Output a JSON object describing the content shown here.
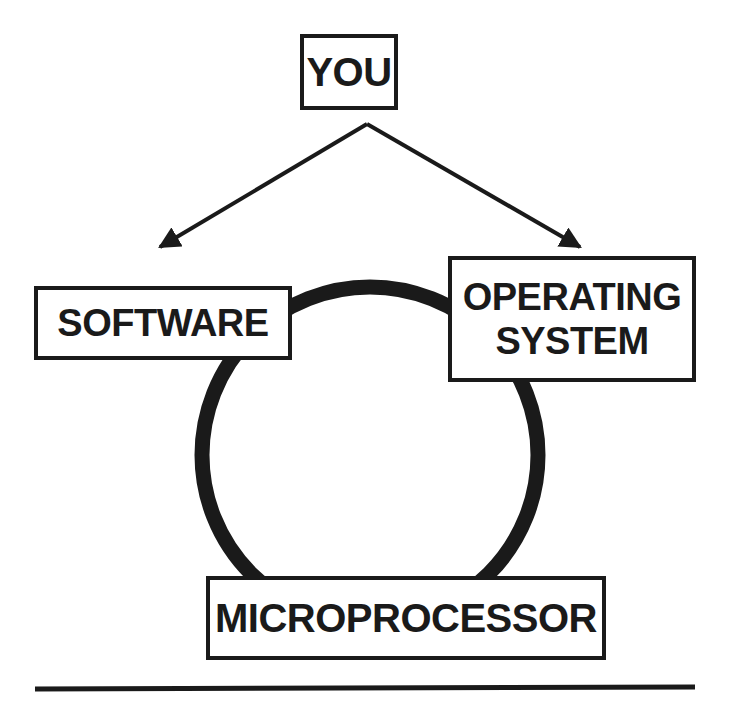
{
  "diagram": {
    "nodes": {
      "you": {
        "label": "YOU"
      },
      "software": {
        "label": "SOFTWARE"
      },
      "operating_system": {
        "line1": "OPERATING",
        "line2": "SYSTEM"
      },
      "microprocessor": {
        "label": "MICROPROCESSOR"
      }
    },
    "edges": [
      {
        "from": "YOU",
        "to": "SOFTWARE",
        "type": "arrow"
      },
      {
        "from": "YOU",
        "to": "OPERATING SYSTEM",
        "type": "arrow"
      }
    ],
    "ring": {
      "connects": [
        "SOFTWARE",
        "OPERATING SYSTEM",
        "MICROPROCESSOR"
      ]
    },
    "colors": {
      "ink": "#1a1a1a",
      "background": "#ffffff"
    }
  }
}
